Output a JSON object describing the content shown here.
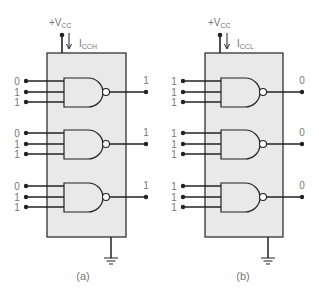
{
  "colors": {
    "chip_fill": "#e9e9e9",
    "line": "#222222",
    "label": "#777777"
  },
  "circuits": [
    {
      "id": "a",
      "caption": "(a)",
      "supply": "+V",
      "supply_sub": "CC",
      "current": "I",
      "current_sub": "CCH",
      "gates": [
        {
          "inputs": [
            "0",
            "1",
            "1"
          ],
          "output": "1"
        },
        {
          "inputs": [
            "0",
            "1",
            "1"
          ],
          "output": "1"
        },
        {
          "inputs": [
            "0",
            "1",
            "1"
          ],
          "output": "1"
        }
      ]
    },
    {
      "id": "b",
      "caption": "(b)",
      "supply": "+V",
      "supply_sub": "CC",
      "current": "I",
      "current_sub": "CCL",
      "gates": [
        {
          "inputs": [
            "1",
            "1",
            "1"
          ],
          "output": "0"
        },
        {
          "inputs": [
            "1",
            "1",
            "1"
          ],
          "output": "0"
        },
        {
          "inputs": [
            "1",
            "1",
            "1"
          ],
          "output": "0"
        }
      ]
    }
  ]
}
